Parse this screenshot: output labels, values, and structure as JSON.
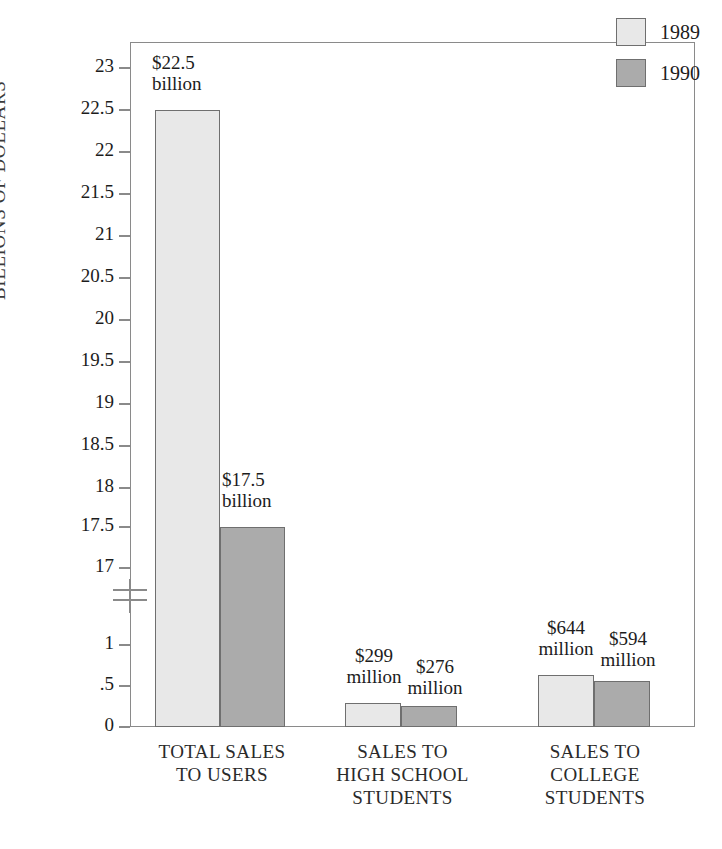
{
  "chart_data": {
    "type": "bar",
    "title": "",
    "xlabel": "",
    "ylabel": "BILLIONS OF DOLLARS",
    "categories": [
      "TOTAL SALES\nTO USERS",
      "SALES TO\nHIGH SCHOOL\nSTUDENTS",
      "SALES TO\nCOLLEGE\nSTUDENTS"
    ],
    "series": [
      {
        "name": "1989",
        "color": "#e8e8e8",
        "values": [
          22.5,
          0.299,
          0.644
        ]
      },
      {
        "name": "1990",
        "color": "#ababab",
        "values": [
          17.5,
          0.276,
          0.594
        ]
      }
    ],
    "data_labels": [
      [
        "$22.5 billion",
        "$17.5 billion"
      ],
      [
        "$299 million",
        "$276 million"
      ],
      [
        "$644 million",
        "$594 million"
      ]
    ],
    "axis_break": true,
    "ylim_upper": [
      17,
      23
    ],
    "ylim_lower": [
      0,
      1
    ],
    "grid": false,
    "legend_position": "top-right",
    "ytick_labels_upper": [
      "23",
      "22.5",
      "22",
      "21.5",
      "21",
      "20.5",
      "20",
      "19.5",
      "19",
      "18.5",
      "18",
      "17.5",
      "17"
    ],
    "ytick_labels_lower": [
      "1",
      ".5",
      "0"
    ]
  },
  "axis": {
    "title": "BILLIONS OF DOLLARS",
    "ticks_upper": [
      {
        "label": "23",
        "y": 68
      },
      {
        "label": "22.5",
        "y": 110
      },
      {
        "label": "22",
        "y": 152
      },
      {
        "label": "21.5",
        "y": 194
      },
      {
        "label": "21",
        "y": 236
      },
      {
        "label": "20.5",
        "y": 278
      },
      {
        "label": "20",
        "y": 320
      },
      {
        "label": "19.5",
        "y": 362
      },
      {
        "label": "19",
        "y": 404
      },
      {
        "label": "18.5",
        "y": 446
      },
      {
        "label": "18",
        "y": 488
      },
      {
        "label": "17.5",
        "y": 527
      },
      {
        "label": "17",
        "y": 568
      }
    ],
    "ticks_lower": [
      {
        "label": "1",
        "y": 645
      },
      {
        "label": ".5",
        "y": 686
      },
      {
        "label": "0",
        "y": 727
      }
    ]
  },
  "legend": {
    "items": [
      {
        "label": "1989",
        "color": "#e8e8e8"
      },
      {
        "label": "1990",
        "color": "#ababab"
      }
    ]
  },
  "bars": [
    {
      "name": "total-sales-1989",
      "series": "1989",
      "label_line1": "$22.5",
      "label_line2": "billion",
      "x": 155,
      "w": 65,
      "top": 110,
      "color": "#e8e8e8"
    },
    {
      "name": "total-sales-1990",
      "series": "1990",
      "label_line1": "$17.5",
      "label_line2": "billion",
      "x": 220,
      "w": 65,
      "top": 527,
      "color": "#ababab"
    },
    {
      "name": "high-school-1989",
      "series": "1989",
      "label_line1": "$299",
      "label_line2": "million",
      "x": 345,
      "w": 56,
      "top": 703,
      "color": "#e8e8e8"
    },
    {
      "name": "high-school-1990",
      "series": "1990",
      "label_line1": "$276",
      "label_line2": "million",
      "x": 401,
      "w": 56,
      "top": 706,
      "color": "#ababab"
    },
    {
      "name": "college-1989",
      "series": "1989",
      "label_line1": "$644",
      "label_line2": "million",
      "x": 538,
      "w": 56,
      "top": 675,
      "color": "#e8e8e8"
    },
    {
      "name": "college-1990",
      "series": "1990",
      "label_line1": "$594",
      "label_line2": "million",
      "x": 594,
      "w": 56,
      "top": 681,
      "color": "#ababab"
    }
  ],
  "value_labels": [
    {
      "name": "label-total-1989",
      "l1": "$22.5",
      "l2": "billion",
      "x": 152,
      "y": 52,
      "align": "left"
    },
    {
      "name": "label-total-1990",
      "l1": "$17.5",
      "l2": "billion",
      "x": 222,
      "y": 469,
      "align": "left"
    },
    {
      "name": "label-high-school-1989",
      "l1": "$299",
      "l2": "million",
      "x": 331,
      "y": 645,
      "align": "center",
      "w": 86
    },
    {
      "name": "label-high-school-1990",
      "l1": "$276",
      "l2": "million",
      "x": 392,
      "y": 656,
      "align": "center",
      "w": 86
    },
    {
      "name": "label-college-1989",
      "l1": "$644",
      "l2": "million",
      "x": 523,
      "y": 617,
      "align": "center",
      "w": 86
    },
    {
      "name": "label-college-1990",
      "l1": "$594",
      "l2": "million",
      "x": 585,
      "y": 628,
      "align": "center",
      "w": 86
    }
  ],
  "categories": [
    {
      "name": "category-total-sales",
      "x": 122,
      "w": 200,
      "lines": [
        "TOTAL SALES",
        "TO USERS"
      ]
    },
    {
      "name": "category-high-school",
      "x": 300,
      "w": 205,
      "lines": [
        "SALES TO",
        "HIGH SCHOOL",
        "STUDENTS"
      ]
    },
    {
      "name": "category-college",
      "x": 495,
      "w": 200,
      "lines": [
        "SALES TO",
        "COLLEGE",
        "STUDENTS"
      ]
    }
  ]
}
